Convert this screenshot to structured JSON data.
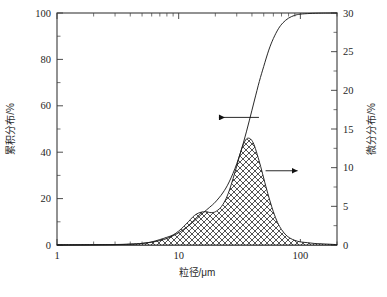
{
  "chart_data": {
    "type": "line",
    "title": "",
    "xlabel": "粒径/μm",
    "ylabel": "累积分布/%",
    "y2label": "微分分布/%",
    "xscale": "log",
    "xlim": [
      1,
      200
    ],
    "ylim": [
      0,
      100
    ],
    "y2lim": [
      0,
      30
    ],
    "grid": false,
    "legend": "none",
    "xticks": [
      1,
      10,
      100
    ],
    "xtick_labels": [
      "1",
      "10",
      "100"
    ],
    "yticks": [
      0,
      20,
      40,
      60,
      80,
      100
    ],
    "ytick_labels": [
      "0",
      "20",
      "40",
      "60",
      "80",
      "100"
    ],
    "y2ticks": [
      0,
      5,
      10,
      15,
      20,
      25,
      30
    ],
    "y2tick_labels": [
      "0",
      "5",
      "10",
      "15",
      "20",
      "25",
      "30"
    ],
    "series": [
      {
        "name": "累积分布",
        "axis": "left",
        "style": "line",
        "x": [
          1.0,
          2.0,
          3.0,
          4.0,
          5.0,
          6.0,
          7.0,
          8.0,
          9.0,
          10.0,
          12.0,
          14.0,
          16.0,
          18.0,
          20.0,
          23.0,
          26.0,
          30.0,
          34.0,
          38.0,
          42.0,
          46.0,
          50.0,
          55.0,
          60.0,
          66.0,
          72.0,
          80.0,
          90.0,
          100.0,
          120.0,
          150.0,
          200.0
        ],
        "values": [
          0.0,
          0.1,
          0.2,
          0.4,
          0.7,
          1.2,
          1.9,
          2.8,
          4.0,
          5.3,
          8.2,
          11.2,
          14.0,
          16.3,
          18.5,
          22.4,
          27.2,
          35.0,
          44.0,
          53.5,
          62.5,
          70.5,
          77.0,
          84.0,
          89.0,
          93.2,
          95.8,
          97.8,
          99.0,
          99.5,
          99.8,
          99.95,
          100.0
        ]
      },
      {
        "name": "微分分布",
        "axis": "right",
        "style": "hatched-area",
        "x": [
          1.0,
          3.0,
          4.0,
          5.0,
          6.0,
          7.0,
          8.0,
          9.0,
          10.0,
          11.0,
          12.0,
          13.0,
          14.0,
          15.0,
          16.0,
          17.0,
          18.0,
          19.0,
          20.0,
          22.0,
          24.0,
          26.0,
          28.0,
          30.0,
          32.0,
          34.0,
          36.0,
          38.0,
          40.0,
          42.0,
          45.0,
          48.0,
          52.0,
          56.0,
          60.0,
          65.0,
          70.0,
          76.0,
          82.0,
          90.0,
          100.0,
          115.0,
          130.0,
          150.0,
          175.0,
          200.0
        ],
        "values": [
          0.0,
          0.05,
          0.1,
          0.2,
          0.4,
          0.7,
          1.0,
          1.3,
          1.8,
          2.4,
          3.0,
          3.6,
          4.0,
          4.2,
          4.3,
          4.3,
          4.2,
          4.2,
          4.3,
          4.8,
          5.7,
          7.0,
          8.6,
          10.2,
          11.8,
          13.0,
          13.7,
          13.8,
          13.5,
          12.8,
          11.3,
          9.7,
          7.6,
          5.8,
          4.3,
          2.9,
          2.0,
          1.3,
          0.9,
          0.6,
          0.4,
          0.3,
          0.2,
          0.15,
          0.1,
          0.05
        ]
      }
    ],
    "annotations": [
      {
        "name": "cumulative-arrow",
        "direction": "left",
        "target": "累积分布",
        "x_data": 24,
        "y_left": 55
      },
      {
        "name": "differential-arrow",
        "direction": "right",
        "target": "微分分布",
        "x_data": 48,
        "y_right": 9.6
      }
    ]
  }
}
